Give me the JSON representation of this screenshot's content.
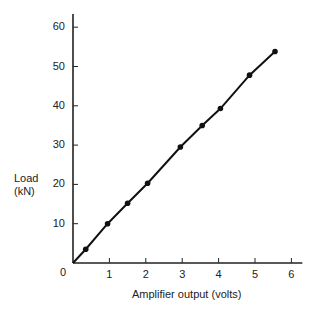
{
  "chart_data": {
    "type": "line",
    "title": "",
    "xlabel": "Amplifier output (volts)",
    "ylabel": "Load (kN)",
    "ylabel_lines": [
      "Load",
      "(kN)"
    ],
    "xlim": [
      0,
      6.3
    ],
    "ylim": [
      0,
      64
    ],
    "x_ticks": [
      1,
      2,
      3,
      4,
      5,
      6
    ],
    "y_ticks": [
      10,
      20,
      30,
      40,
      50,
      60
    ],
    "origin_label": "0",
    "grid": false,
    "legend": null,
    "series": [
      {
        "name": "Load vs amplifier output",
        "markers": true,
        "line_from_origin": true,
        "x": [
          0.35,
          0.95,
          1.5,
          2.05,
          2.95,
          3.55,
          4.05,
          4.85,
          5.55
        ],
        "y": [
          3.5,
          10,
          15.2,
          20.3,
          29.5,
          35,
          39.3,
          47.8,
          53.8
        ]
      }
    ]
  }
}
